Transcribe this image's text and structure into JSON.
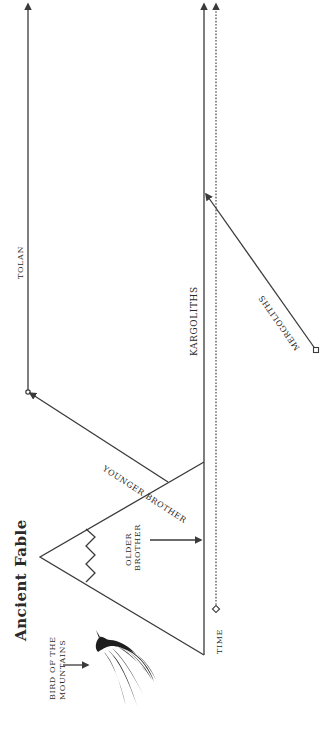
{
  "title": "Ancient Fable",
  "orientation": "rotated 90° counter-clockwise",
  "colors": {
    "ink": "#2a2a2a",
    "background": "#ffffff"
  },
  "labels": {
    "bird": "BIRD OF THE",
    "bird_line2": "MOUNTAINS",
    "older_brother": "OLDER",
    "older_brother_line2": "BROTHER",
    "younger_brother": "YOUNGER BROTHER",
    "tolan": "TOLAN",
    "kargoliths": "KARGOLITHS",
    "mergoliths": "MERGOLITHS",
    "time": "TIME"
  },
  "lines": [
    {
      "name": "time",
      "style": "dotted",
      "start": "diamond",
      "end": "arrow"
    },
    {
      "name": "kargoliths",
      "style": "solid",
      "end": "arrow"
    },
    {
      "name": "tolan",
      "style": "solid",
      "start": "circle",
      "end": "arrow"
    },
    {
      "name": "younger-brother",
      "style": "solid",
      "from": "mountain",
      "to": "tolan"
    },
    {
      "name": "mergoliths",
      "style": "solid",
      "start": "square",
      "end": "arrow",
      "to": "kargoliths"
    },
    {
      "name": "older-brother",
      "style": "arrow",
      "to": "kargoliths"
    }
  ],
  "icons": {
    "bird": "bird-of-the-mountains-icon",
    "mountain": "mountain-triangle-icon"
  }
}
